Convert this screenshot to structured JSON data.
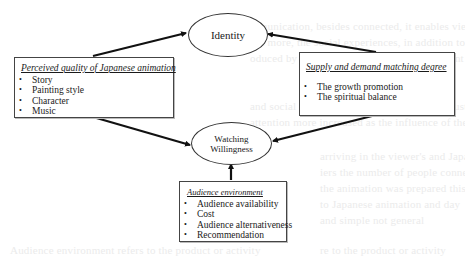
{
  "diagram": {
    "nodes": {
      "identity": {
        "label": "Identity"
      },
      "watching_willingness": {
        "line1": "Watching",
        "line2": "Willingness"
      }
    },
    "boxes": {
      "perceived_quality": {
        "title": "Perceived quality of Japanese animation",
        "items": [
          "Story",
          "Painting style",
          "Character",
          "Music"
        ]
      },
      "supply_demand": {
        "title": "Supply and demand matching degree",
        "items": [
          "The growth promotion",
          "The spiritual balance"
        ]
      },
      "audience_environment": {
        "title": "Audience environment",
        "items": [
          "Audience availability",
          "Cost",
          "Audience alternativeness",
          "Recommendation"
        ]
      }
    },
    "edges": [
      {
        "from": "Perceived quality of Japanese animation",
        "to": "Identity"
      },
      {
        "from": "Perceived quality of Japanese animation",
        "to": "Watching Willingness"
      },
      {
        "from": "Supply and demand matching degree",
        "to": "Identity"
      },
      {
        "from": "Supply and demand matching degree",
        "to": "Watching Willingness"
      },
      {
        "from": "Audience environment",
        "to": "Watching Willingness"
      }
    ],
    "colors": {
      "line": "#111111",
      "border": "#444444",
      "background": "#ffffff"
    }
  }
}
